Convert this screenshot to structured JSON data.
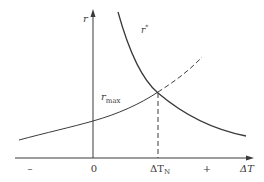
{
  "diagram": {
    "axes": {
      "y_label": "r",
      "x_label": "ΔT",
      "x_label_base": "ΔT",
      "origin_label": "0",
      "negative_label": "–",
      "positive_label": "+"
    },
    "curves": {
      "decreasing": {
        "label": "r*",
        "label_base": "r",
        "label_sup": "*",
        "style": "solid"
      },
      "increasing": {
        "label": "r_max",
        "label_base": "r",
        "label_sub": "max",
        "style": "solid",
        "extension_style": "dashed"
      }
    },
    "intersection": {
      "marker_label": "ΔT_N",
      "marker_label_base": "ΔT",
      "marker_label_sub": "N",
      "drop_line_style": "dashed"
    },
    "colors": {
      "line": "#3a3a3a",
      "background": "#ffffff"
    }
  }
}
